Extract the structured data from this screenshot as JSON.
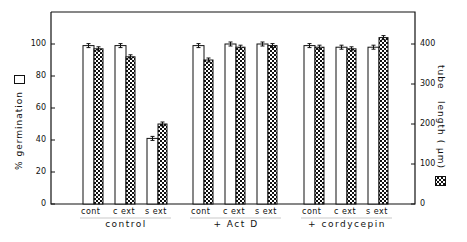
{
  "chart_data": {
    "type": "bar",
    "title": "",
    "ylabel": "% germination (□)",
    "y2label": "tube length (µm) (▦)",
    "ylim": [
      0,
      115
    ],
    "y2lim": [
      0,
      460
    ],
    "yticks": [
      0,
      20,
      40,
      60,
      80,
      100
    ],
    "y2ticks": [
      0,
      100,
      200,
      300,
      400
    ],
    "groups": [
      "control",
      "+ Act D",
      "+ cordycepin"
    ],
    "categories": [
      "cont",
      "c ext",
      "s ext"
    ],
    "series": [
      {
        "name": "% germination",
        "fill": "open",
        "axis": "left",
        "values": [
          [
            99,
            99,
            41
          ],
          [
            99,
            100,
            100
          ],
          [
            99,
            98,
            98
          ]
        ]
      },
      {
        "name": "tube length (µm)",
        "fill": "checkered",
        "axis": "right",
        "values": [
          [
            388,
            368,
            200
          ],
          [
            360,
            392,
            396
          ],
          [
            392,
            388,
            416
          ]
        ]
      }
    ],
    "error_bars": true,
    "grid": false,
    "legend": "in axis labels"
  },
  "labels": {
    "ylabel": "% germination",
    "y2label_a": "tube",
    "y2label_b": "length ( µm)",
    "cats": [
      "cont",
      "c ext",
      "s ext"
    ],
    "groups": [
      "control",
      "+ Act D",
      "+ cordycepin"
    ],
    "yticks": [
      "0",
      "20",
      "40",
      "60",
      "80",
      "100"
    ],
    "y2ticks": [
      "0",
      "100",
      "200",
      "300",
      "400"
    ]
  }
}
